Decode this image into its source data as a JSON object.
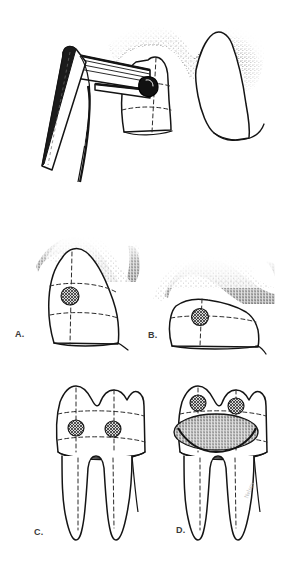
{
  "figure": {
    "type": "line-drawing-illustration",
    "background_color": "#ffffff",
    "ink_color": "#1a1a1a",
    "stipple_color": "#202020",
    "dashed_guideline_color": "#2a2a2a",
    "width_px": 288,
    "height_px": 562
  },
  "panels": [
    {
      "id": "top",
      "label": "",
      "caption": "Handpiece with bur and mirror accessing proximal lesion on tooth with stippled gingiva",
      "elements": [
        "dental-mirror",
        "handpiece-shank",
        "round-bur",
        "prepared-tooth",
        "adjacent-tooth",
        "stippled-gingiva"
      ]
    },
    {
      "id": "a",
      "label": "A.",
      "caption": "Proximal view of crown with single carious lesion and stippled gingival tissue",
      "elements": [
        "tooth-crown",
        "caries-lesion",
        "stippled-gingiva",
        "dashed-guidelines"
      ]
    },
    {
      "id": "b",
      "label": "B.",
      "caption": "Proximal view of crown with carious lesion and heavy stippled gingival tissue",
      "elements": [
        "tooth-crown",
        "caries-lesion",
        "stippled-gingiva",
        "dashed-guidelines"
      ]
    },
    {
      "id": "c",
      "label": "C.",
      "caption": "Facial view of two-rooted molar with two carious lesions",
      "elements": [
        "tooth-crown",
        "tooth-roots",
        "caries-lesion",
        "caries-lesion",
        "dashed-guidelines"
      ]
    },
    {
      "id": "d",
      "label": "D.",
      "caption": "Facial view of two-rooted molar with two carious lesions and stippled prepared cavity",
      "elements": [
        "tooth-crown",
        "tooth-roots",
        "caries-lesion",
        "caries-lesion",
        "stippled-cavity-preparation",
        "dashed-guidelines"
      ]
    }
  ],
  "signature": {
    "text": "Nelson"
  }
}
